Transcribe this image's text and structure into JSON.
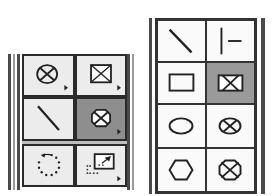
{
  "left_palette": {
    "tools": [
      {
        "name": "circle-x-tool",
        "icon": "circle-x-icon",
        "selected": false,
        "has_submenu": true
      },
      {
        "name": "box-x-tool",
        "icon": "box-x-icon",
        "selected": false,
        "has_submenu": true
      },
      {
        "name": "line-tool",
        "icon": "diagonal-line-icon",
        "selected": false,
        "has_submenu": false
      },
      {
        "name": "octagon-x-tool",
        "icon": "octagon-x-icon",
        "selected": true,
        "has_submenu": true
      },
      {
        "name": "rotate-tool",
        "icon": "rotate-dotted-icon",
        "selected": false,
        "has_submenu": false
      },
      {
        "name": "scale-tool",
        "icon": "scale-box-icon",
        "selected": false,
        "has_submenu": true
      }
    ]
  },
  "right_palette": {
    "tools": [
      {
        "name": "diagonal-line-tool",
        "icon": "diagonal-line-icon",
        "selected": false
      },
      {
        "name": "connector-tool",
        "icon": "bar-dash-icon",
        "selected": false
      },
      {
        "name": "rectangle-tool",
        "icon": "rectangle-icon",
        "selected": false
      },
      {
        "name": "box-x-tool",
        "icon": "box-x-icon",
        "selected": true
      },
      {
        "name": "ellipse-tool",
        "icon": "ellipse-icon",
        "selected": false
      },
      {
        "name": "circle-x-tool",
        "icon": "circle-x-icon",
        "selected": false
      },
      {
        "name": "hexagon-tool",
        "icon": "hexagon-icon",
        "selected": false
      },
      {
        "name": "octagon-x-tool",
        "icon": "octagon-x-icon",
        "selected": false
      }
    ]
  },
  "colors": {
    "selected_bg": "#8e8e8e",
    "cell_bg": "#ececec",
    "border": "#2a2a2a"
  }
}
